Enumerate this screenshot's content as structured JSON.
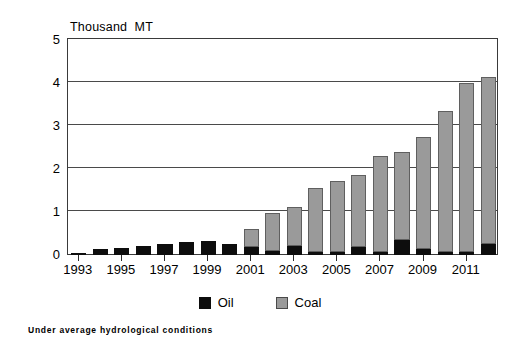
{
  "chart_data": {
    "type": "bar",
    "stacked": true,
    "title": "",
    "subtitle": "",
    "xlabel": "",
    "ylabel": "Thousand  MT",
    "ylim": [
      0,
      5
    ],
    "yticks": [
      0,
      1,
      2,
      3,
      4,
      5
    ],
    "grid": true,
    "legend_position": "bottom",
    "footnote": "Under average hydrological conditions",
    "categories": [
      "1993",
      "1994",
      "1995",
      "1996",
      "1997",
      "1998",
      "1999",
      "2000",
      "2001",
      "2002",
      "2003",
      "2004",
      "2005",
      "2006",
      "2007",
      "2008",
      "2009",
      "2010",
      "2011",
      "2012"
    ],
    "xtick_labels": [
      "1993",
      "1995",
      "1997",
      "1999",
      "2001",
      "2003",
      "2005",
      "2007",
      "2009",
      "2011"
    ],
    "series": [
      {
        "name": "Oil",
        "color": "#0d0d0d",
        "values": [
          0.03,
          0.13,
          0.17,
          0.22,
          0.25,
          0.3,
          0.32,
          0.25,
          0.18,
          0.1,
          0.2,
          0.07,
          0.08,
          0.18,
          0.08,
          0.36,
          0.14,
          0.07,
          0.07,
          0.26
        ]
      },
      {
        "name": "Coal",
        "color": "#9a9a9a",
        "values": [
          0.0,
          0.0,
          0.0,
          0.0,
          0.0,
          0.0,
          0.0,
          0.0,
          0.42,
          0.87,
          0.92,
          1.49,
          1.63,
          1.67,
          2.22,
          2.04,
          2.61,
          3.28,
          3.93,
          3.89
        ]
      }
    ],
    "totals": [
      0.03,
      0.13,
      0.17,
      0.22,
      0.25,
      0.3,
      0.32,
      0.25,
      0.6,
      0.97,
      1.12,
      1.56,
      1.71,
      1.85,
      2.3,
      2.4,
      2.75,
      3.35,
      4.0,
      4.15
    ]
  },
  "legend": {
    "items": [
      {
        "label": "Oil",
        "color": "#0d0d0d"
      },
      {
        "label": "Coal",
        "color": "#9a9a9a"
      }
    ]
  }
}
